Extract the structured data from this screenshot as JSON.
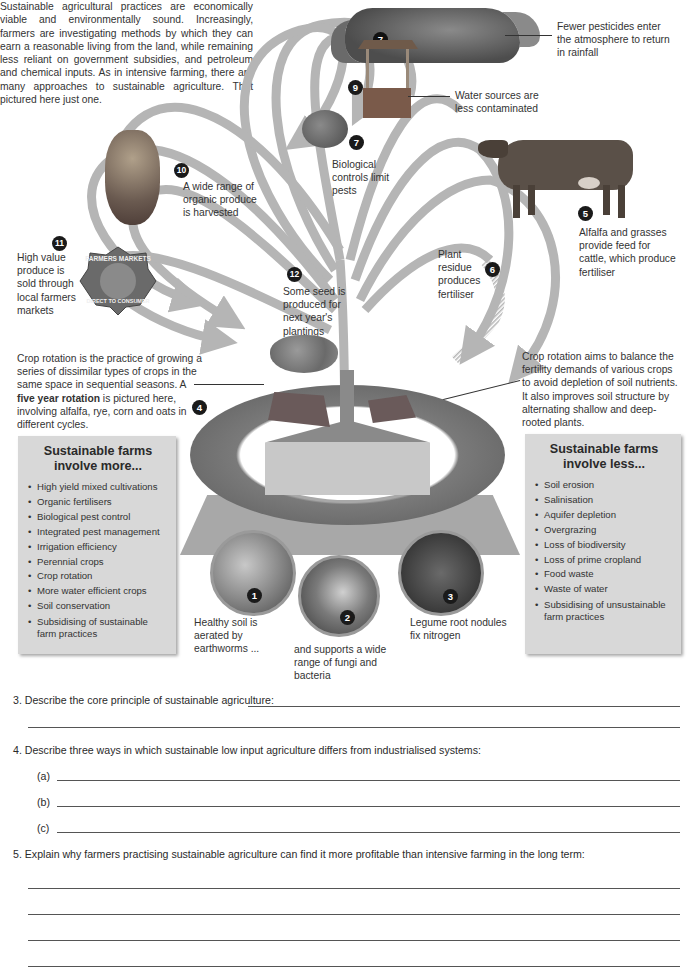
{
  "intro": {
    "text": "Sustainable agricultural practices are economically viable and environmentally sound. Increasingly, farmers are investigating methods by which they can earn a reasonable living from the land, while remaining less reliant on government subsidies, and petroleum and chemical inputs. As in intensive farming, there are many approaches to sustainable agriculture. That pictured here just one."
  },
  "callouts": [
    {
      "num": "1",
      "text": "Healthy soil is aerated by earthworms ..."
    },
    {
      "num": "2",
      "text": "and supports a wide range of fungi and bacteria"
    },
    {
      "num": "3",
      "text": "Legume root nodules fix nitrogen"
    },
    {
      "num": "4",
      "text": ""
    },
    {
      "num": "5",
      "text": "Alfalfa and grasses provide feed for cattle, which produce fertiliser"
    },
    {
      "num": "6",
      "text": "Plant residue produces fertiliser"
    },
    {
      "num": "7",
      "text": "Biological controls limit pests"
    },
    {
      "num": "8",
      "text": "Fewer pesticides enter the atmosphere to return in rainfall"
    },
    {
      "num": "9",
      "text": "Water sources are less contaminated"
    },
    {
      "num": "10",
      "text": "A wide range of organic produce is harvested"
    },
    {
      "num": "11",
      "text": "High value produce is sold through local farmers markets"
    },
    {
      "num": "12",
      "text": "Some seed is produced for next year's plantings"
    }
  ],
  "crop_rotation_left": {
    "pre": "Crop rotation is the practice of growing a series of dissimilar types of crops in the same space in sequential seasons. A ",
    "bold": "five year rotation",
    "post": " is pictured here, involving alfalfa, rye, corn and oats in different cycles."
  },
  "crop_rotation_right": {
    "text": "Crop rotation aims to balance the fertility demands of various crops to avoid depletion of soil nutrients. It also improves soil structure by alternating shallow and deep-rooted plants."
  },
  "market_badge": {
    "top": "FARMERS MARKETS",
    "bottom": "DIRECT TO CONSUMER"
  },
  "box_more": {
    "title": "Sustainable farms involve more...",
    "items": [
      "High yield mixed cultivations",
      "Organic fertilisers",
      "Biological pest control",
      "Integrated pest management",
      "Irrigation efficiency",
      "Perennial crops",
      "Crop rotation",
      "More water efficient crops",
      "Soil conservation",
      "Subsidising of sustainable farm practices"
    ]
  },
  "box_less": {
    "title": "Sustainable farms involve less...",
    "items": [
      "Soil erosion",
      "Salinisation",
      "Aquifer depletion",
      "Overgrazing",
      "Loss of biodiversity",
      "Loss of prime cropland",
      "Food waste",
      "Waste of water",
      "Subsidising of unsustainable farm practices"
    ]
  },
  "questions": {
    "q3": {
      "label": "3.  Describe the core principle of sustainable agriculture:",
      "answer": ""
    },
    "q4": {
      "label": "4. Describe three ways in which sustainable low input agriculture differs from industrialised systems:",
      "parts": [
        {
          "label": "(a)",
          "answer": ""
        },
        {
          "label": "(b)",
          "answer": ""
        },
        {
          "label": "(c)",
          "answer": ""
        }
      ]
    },
    "q5": {
      "label": "5.  Explain why farmers practising sustainable agriculture can find it more profitable than intensive farming in the long term:",
      "answer": ""
    }
  },
  "colors": {
    "arrow": "#b5b5b5",
    "badge": "#1a1a1a",
    "box": "#d8d8d8",
    "text": "#333333"
  }
}
